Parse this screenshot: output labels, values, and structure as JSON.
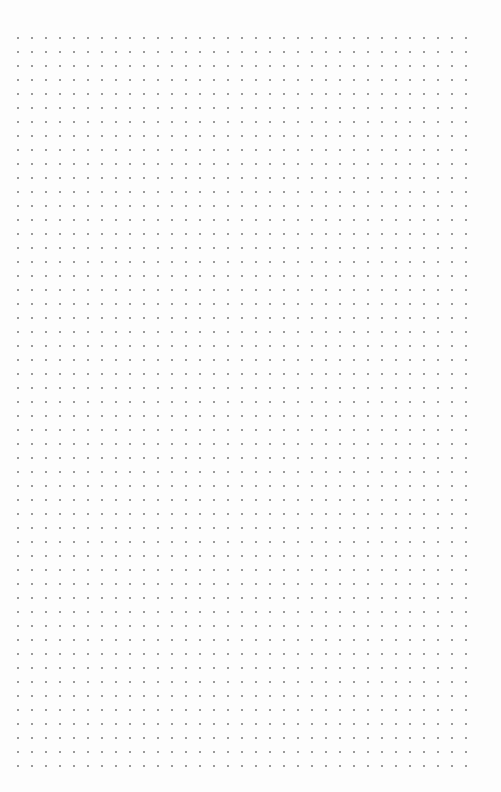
{
  "page": {
    "type": "dot-grid-paper",
    "dot_color": "#9a9a9a",
    "background_color": "#fdfdfd",
    "dot_spacing_px": 14,
    "columns": 33,
    "rows": 53
  }
}
